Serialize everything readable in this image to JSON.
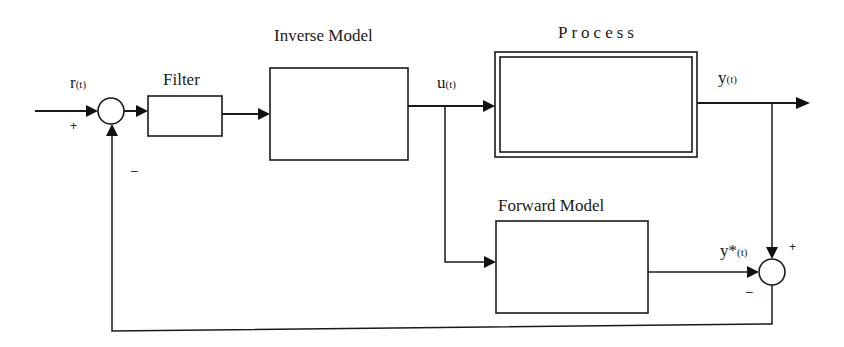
{
  "diagram": {
    "type": "block-diagram",
    "blocks": {
      "filter": {
        "label": "Filter"
      },
      "inverse_model": {
        "label": "Inverse Model"
      },
      "process": {
        "label": "Process"
      },
      "forward_model": {
        "label": "Forward Model"
      }
    },
    "signals": {
      "reference": {
        "symbol": "r",
        "arg": "(t)"
      },
      "control": {
        "symbol": "u",
        "arg": "(t)"
      },
      "output": {
        "symbol": "y",
        "arg": "(t)"
      },
      "model_output": {
        "symbol": "y*",
        "arg": "(t)"
      }
    },
    "summing_junctions": {
      "input_sum": {
        "plus_sign": "+",
        "minus_sign": "–"
      },
      "error_sum": {
        "plus_sign": "+",
        "minus_sign": "–"
      }
    },
    "connections": [
      "r(t) -> input_sum (+)",
      "input_sum -> Filter",
      "Filter -> Inverse Model",
      "Inverse Model -> u(t)",
      "u(t) -> Process",
      "u(t) -> Forward Model",
      "Process -> y(t)",
      "y(t) -> error_sum (+)",
      "Forward Model -> y*(t) -> error_sum (-)",
      "error_sum -> input_sum (-)"
    ]
  }
}
